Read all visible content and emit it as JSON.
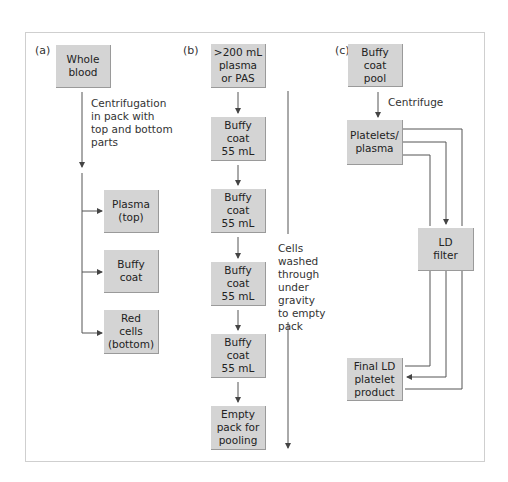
{
  "panels": {
    "a": {
      "label": "(a)",
      "source": "Whole\nblood",
      "step_note": "Centrifugation\nin pack with\ntop and bottom\nparts",
      "outputs": [
        "Plasma\n(top)",
        "Buffy\ncoat",
        "Red\ncells\n(bottom)"
      ]
    },
    "b": {
      "label": "(b)",
      "top": ">200 mL\nplasma\nor PAS",
      "buffy_coats": [
        "Buffy\ncoat\n55 mL",
        "Buffy\ncoat\n55 mL",
        "Buffy\ncoat\n55 mL",
        "Buffy\ncoat\n55 mL"
      ],
      "bottom": "Empty\npack for\npooling",
      "side_note": "Cells\nwashed\nthrough\nunder\ngravity\nto empty\npack"
    },
    "c": {
      "label": "(c)",
      "source": "Buffy\ncoat\npool",
      "step_note": "Centrifuge",
      "intermediate": "Platelets/\nplasma",
      "filter": "LD\nfilter",
      "product": "Final LD\nplatelet\nproduct"
    }
  },
  "colors": {
    "box_fill": "#d4d4d4",
    "line": "#555555",
    "frame": "#cfcfcf"
  }
}
